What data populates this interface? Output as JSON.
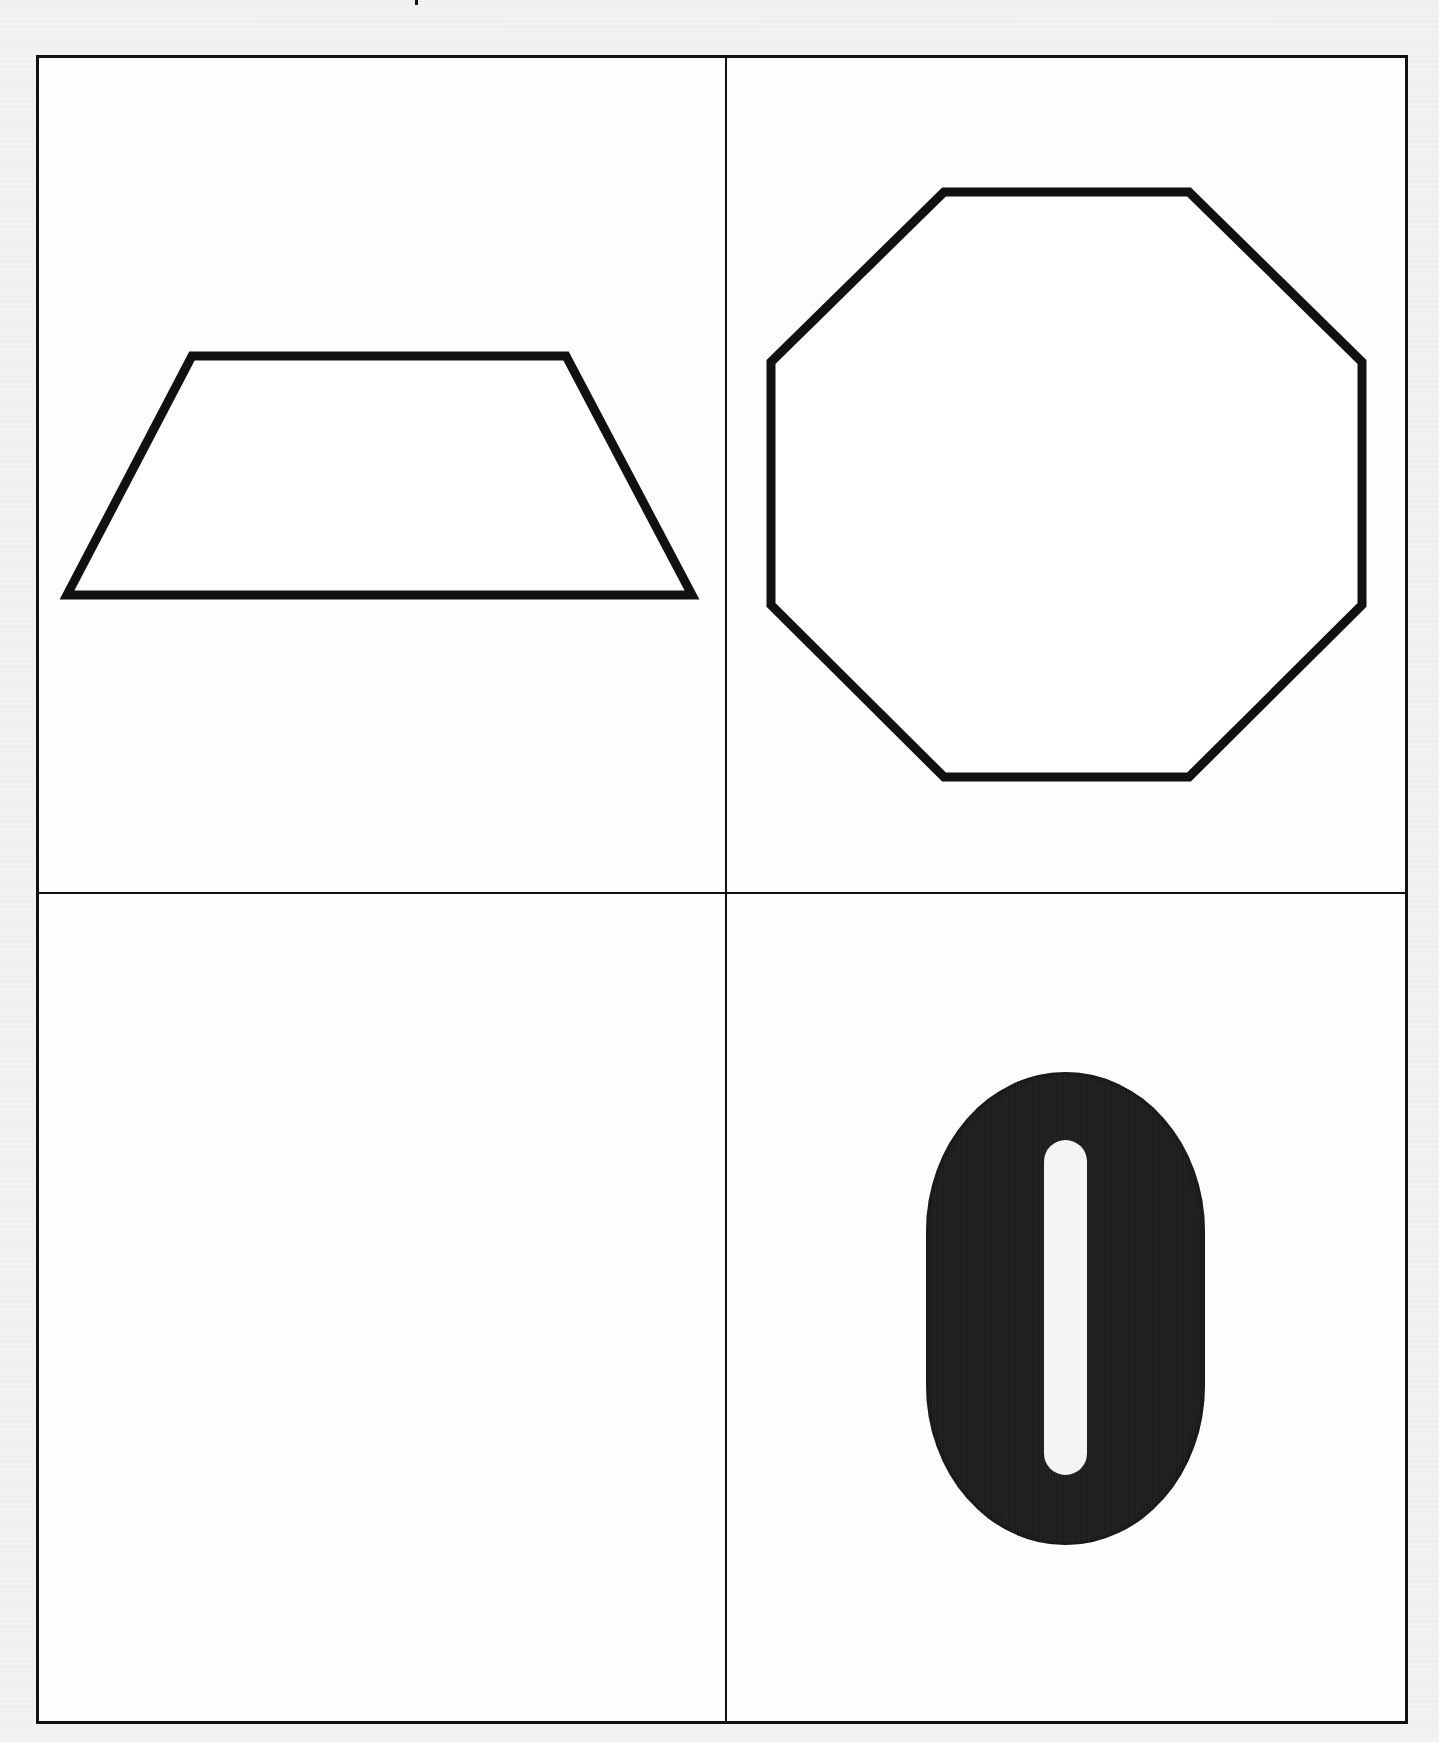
{
  "page": {
    "background": "#f2f2f2",
    "cell_background": "#fdfdfd",
    "line_color": "#111111"
  },
  "grid": {
    "rows": 2,
    "cols": 2,
    "cells": [
      {
        "position": "top-left",
        "content": "trapezoid",
        "label": "Trapezoid"
      },
      {
        "position": "top-right",
        "content": "octagon",
        "label": "Octagon"
      },
      {
        "position": "bottom-left",
        "content": "empty",
        "label": ""
      },
      {
        "position": "bottom-right",
        "content": "glyph",
        "label": "Number zero",
        "glyph": "0"
      }
    ]
  },
  "shapes": {
    "trapezoid": {
      "points": [
        [
          192,
          356
        ],
        [
          566,
          356
        ],
        [
          692,
          595
        ],
        [
          67,
          595
        ]
      ],
      "stroke": "#111111",
      "stroke_width": 9
    },
    "octagon": {
      "points": [
        [
          944,
          192
        ],
        [
          1189,
          192
        ],
        [
          1362,
          362
        ],
        [
          1362,
          605
        ],
        [
          1189,
          777
        ],
        [
          944,
          777
        ],
        [
          771,
          605
        ],
        [
          771,
          362
        ]
      ],
      "stroke": "#111111",
      "stroke_width": 9
    },
    "zero": {
      "character": "0",
      "fill": "#1e1e1e"
    }
  }
}
